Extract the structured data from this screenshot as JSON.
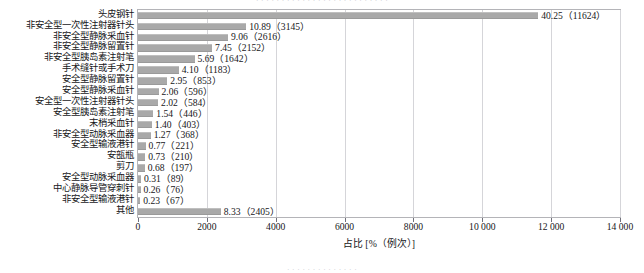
{
  "bleed": {
    "top_fragment": "· · · · · · · · · · · · · · · · · · · · · · · · · ·",
    "bottom_fragment": "· · · · · · · · · · · · · ·"
  },
  "axis": {
    "x_title": "占比 [%（例次）]",
    "x_ticks": [
      "0",
      "2000",
      "4000",
      "6000",
      "8000",
      "10 000",
      "12 000",
      "14 000"
    ],
    "x_tick_values": [
      0,
      2000,
      4000,
      6000,
      8000,
      10000,
      12000,
      14000
    ],
    "x_min": 0,
    "x_max": 14000
  },
  "style": {
    "bar_color": "#a9a9a9",
    "grid_color": "#d5d5d9",
    "border_color": "#b4b4b8",
    "text_color": "#17171a"
  },
  "chart_data": {
    "type": "bar",
    "orientation": "horizontal",
    "title": "",
    "xlabel": "占比 [%（例次）]",
    "ylabel": "",
    "xlim": [
      0,
      14000
    ],
    "grid": true,
    "legend": false,
    "categories": [
      "头皮钢针",
      "非安全型一次性注射器针头",
      "非安全型静脉采血针",
      "非安全型静脉留置针",
      "非安全型胰岛素注射笔",
      "手术缝针或手术刀",
      "安全型静脉留置针",
      "安全型静脉采血针",
      "安全型一次性注射器针头",
      "安全型胰岛素注射笔",
      "末梢采血针",
      "非安全型动脉采血器",
      "安全型输液港针",
      "安瓿瓶",
      "剪刀",
      "安全型动脉采血器",
      "中心静脉导管穿刺针",
      "非安全型输液港针",
      "其他"
    ],
    "values": [
      11624,
      3145,
      2616,
      2152,
      1642,
      1183,
      853,
      596,
      584,
      446,
      403,
      368,
      221,
      210,
      197,
      89,
      76,
      67,
      2405
    ],
    "percentages": [
      40.25,
      10.89,
      9.06,
      7.45,
      5.69,
      4.1,
      2.95,
      2.06,
      2.02,
      1.54,
      1.4,
      1.27,
      0.77,
      0.73,
      0.68,
      0.31,
      0.26,
      0.23,
      8.33
    ],
    "data_labels": [
      "40.25（11624）",
      "10.89（3145）",
      "9.06（2616）",
      "7.45（2152）",
      "5.69（1642）",
      "4.10（1183）",
      "2.95（853）",
      "2.06（596）",
      "2.02（584）",
      "1.54（446）",
      "1.40（403）",
      "1.27（368）",
      "0.77（221）",
      "0.73（210）",
      "0.68（197）",
      "0.31（89）",
      "0.26（76）",
      "0.23（67）",
      "8.33（2405）"
    ]
  }
}
